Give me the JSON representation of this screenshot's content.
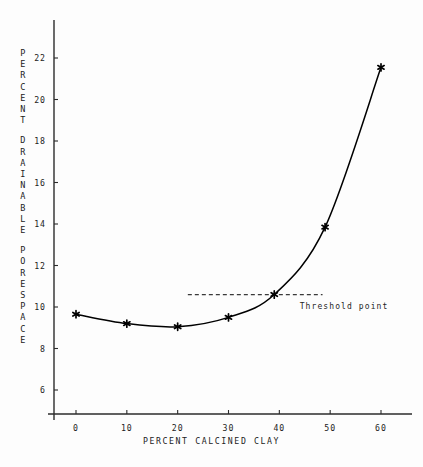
{
  "chart_data": {
    "type": "line",
    "title": "",
    "xlabel": "PERCENT CALCINED CLAY",
    "ylabel": "PERCENT DRAINABLE PORESPACE",
    "ylabel_words": [
      "PERCENT",
      "DRAINABLE",
      "PORESPACE"
    ],
    "x": [
      0,
      10,
      20,
      30,
      39,
      49,
      60
    ],
    "values": [
      9.65,
      9.2,
      9.05,
      9.5,
      10.6,
      13.85,
      21.55
    ],
    "series": [
      {
        "name": "Percent drainable porespace",
        "x": [
          0,
          10,
          20,
          30,
          39,
          49,
          60
        ],
        "values": [
          9.65,
          9.2,
          9.05,
          9.5,
          10.6,
          13.85,
          21.55
        ],
        "marker": "asterisk",
        "color": "#000000"
      }
    ],
    "xlim": [
      -3,
      64
    ],
    "ylim": [
      5.0,
      23.0
    ],
    "xticks": [
      0,
      10,
      20,
      30,
      40,
      50,
      60
    ],
    "xtick_labels": [
      "0",
      "10",
      "20",
      "30",
      "40",
      "50",
      "60"
    ],
    "yticks": [
      6,
      8,
      10,
      12,
      14,
      16,
      18,
      20,
      22
    ],
    "ytick_labels": [
      "6",
      "8",
      "10",
      "12",
      "14",
      "16",
      "18",
      "20",
      "22"
    ],
    "grid": false,
    "legend": null,
    "annotations": [
      {
        "name": "threshold-point",
        "label": "Threshold point",
        "dashed_line_y": 10.6,
        "dashed_line_x_start": 22,
        "dashed_line_x_end": 48.5,
        "label_x": 44,
        "label_y": 10.05
      }
    ]
  },
  "axes": {
    "x_title": "PERCENT CALCINED CLAY",
    "y_title": "PERCENT DRAINABLE PORESPACE"
  },
  "colors": {
    "curve": "#000000",
    "marker": "#000000",
    "axis": "#2b2b2b",
    "dashed": "#3a3a3a",
    "background": "#fdfdfd",
    "text": "#1f1f1f"
  }
}
